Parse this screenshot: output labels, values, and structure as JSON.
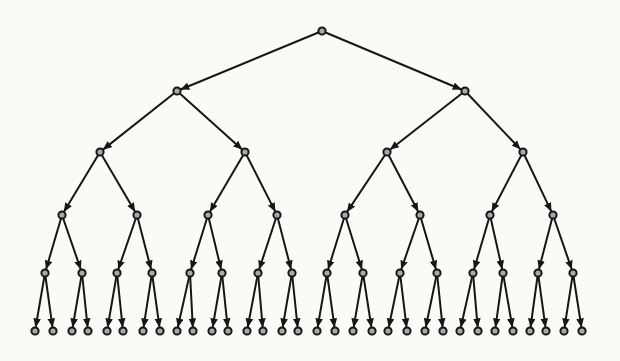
{
  "figure": {
    "title": "",
    "node_counts_per_level": [
      1,
      2,
      4,
      8,
      16,
      32
    ],
    "total_nodes": 63
  },
  "diagram": {
    "type": "binary-tree",
    "background_color": "#fbfaf7",
    "ink_color": "#161616",
    "node_fill_color": "#a8a8a8",
    "node_stroke_color": "#161616",
    "node_radius": 3.6,
    "node_stroke_width": 2,
    "edge_stroke_width": 2,
    "arrow_length": 9,
    "arrow_half_width": 3.8,
    "levels": [
      {
        "y": 31,
        "xs": [
          322
        ]
      },
      {
        "y": 91,
        "xs": [
          177,
          465
        ]
      },
      {
        "y": 152,
        "xs": [
          100,
          245,
          387,
          523
        ]
      },
      {
        "y": 215,
        "xs": [
          62,
          137,
          208,
          277,
          345,
          420,
          490,
          553
        ]
      },
      {
        "y": 273,
        "xs": [
          45,
          82,
          117,
          152,
          190,
          222,
          258,
          292,
          327,
          363,
          400,
          437,
          473,
          503,
          538,
          573
        ]
      },
      {
        "y": 331,
        "xs": [
          35,
          53,
          72,
          88,
          107,
          123,
          143,
          160,
          177,
          193,
          212,
          228,
          247,
          263,
          282,
          298,
          317,
          335,
          353,
          372,
          388,
          407,
          425,
          443,
          460,
          478,
          495,
          513,
          530,
          546,
          564,
          582
        ]
      }
    ]
  }
}
